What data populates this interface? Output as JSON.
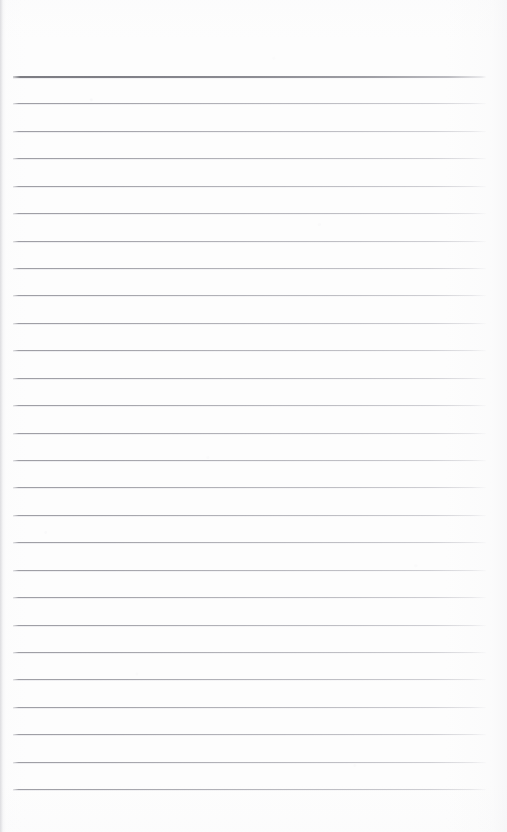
{
  "document": {
    "kind": "scanned-lined-notebook-page",
    "title": "Blank ruled notebook page",
    "page_width": 507,
    "page_height": 832,
    "background_color": "#fdfdfd",
    "content_text": "",
    "handwriting_present": "no",
    "printed_text_present": "no"
  },
  "ruling": {
    "line_count": 27,
    "first_line_y": 76,
    "last_line_y": 789,
    "line_spacing": 27.4,
    "line_start_x": 13,
    "line_end_x": 486,
    "line_length": 473,
    "normal_line_color": "#a0a0a7",
    "heavy_line_color": "#808086",
    "heavy_line_index": 0,
    "normal_line_thickness": 1,
    "heavy_line_thickness": 2
  },
  "margins": {
    "top_margin": 76,
    "bottom_margin": 43,
    "left_margin": 13,
    "right_margin": 21,
    "vertical_margin_rule": "none"
  },
  "lines": [
    {
      "index": 1,
      "y": 76,
      "weight": "heavy"
    },
    {
      "index": 2,
      "y": 103,
      "weight": "normal"
    },
    {
      "index": 3,
      "y": 131,
      "weight": "normal"
    },
    {
      "index": 4,
      "y": 158,
      "weight": "normal"
    },
    {
      "index": 5,
      "y": 186,
      "weight": "normal"
    },
    {
      "index": 6,
      "y": 213,
      "weight": "normal"
    },
    {
      "index": 7,
      "y": 241,
      "weight": "normal"
    },
    {
      "index": 8,
      "y": 268,
      "weight": "normal"
    },
    {
      "index": 9,
      "y": 295,
      "weight": "normal"
    },
    {
      "index": 10,
      "y": 323,
      "weight": "normal"
    },
    {
      "index": 11,
      "y": 350,
      "weight": "normal"
    },
    {
      "index": 12,
      "y": 378,
      "weight": "normal"
    },
    {
      "index": 13,
      "y": 405,
      "weight": "normal"
    },
    {
      "index": 14,
      "y": 433,
      "weight": "normal"
    },
    {
      "index": 15,
      "y": 460,
      "weight": "normal"
    },
    {
      "index": 16,
      "y": 487,
      "weight": "normal"
    },
    {
      "index": 17,
      "y": 515,
      "weight": "normal"
    },
    {
      "index": 18,
      "y": 542,
      "weight": "normal"
    },
    {
      "index": 19,
      "y": 570,
      "weight": "normal"
    },
    {
      "index": 20,
      "y": 597,
      "weight": "normal"
    },
    {
      "index": 21,
      "y": 625,
      "weight": "normal"
    },
    {
      "index": 22,
      "y": 652,
      "weight": "normal"
    },
    {
      "index": 23,
      "y": 679,
      "weight": "normal"
    },
    {
      "index": 24,
      "y": 707,
      "weight": "normal"
    },
    {
      "index": 25,
      "y": 734,
      "weight": "normal"
    },
    {
      "index": 26,
      "y": 762,
      "weight": "normal"
    },
    {
      "index": 27,
      "y": 789,
      "weight": "normal"
    }
  ]
}
